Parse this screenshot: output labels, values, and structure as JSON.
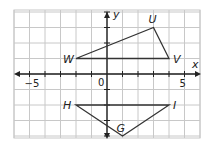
{
  "diagram": {
    "axes": {
      "x_label": "x",
      "y_label": "y",
      "x_range": [
        -6,
        6
      ],
      "y_range": [
        -4,
        4
      ],
      "origin_label": "0"
    },
    "tick_labels": [
      {
        "text": "−5",
        "value": -5
      },
      {
        "text": "5",
        "value": 5
      }
    ],
    "shapes": [
      {
        "name": "triangle-UVW",
        "vertices": [
          {
            "label": "U",
            "x": 3,
            "y": 3
          },
          {
            "label": "V",
            "x": 4,
            "y": 1
          },
          {
            "label": "W",
            "x": -2,
            "y": 1
          }
        ]
      },
      {
        "name": "triangle-GHI",
        "vertices": [
          {
            "label": "H",
            "x": -2,
            "y": -2
          },
          {
            "label": "I",
            "x": 4,
            "y": -2
          },
          {
            "label": "G",
            "x": 1,
            "y": -4
          }
        ]
      }
    ]
  }
}
